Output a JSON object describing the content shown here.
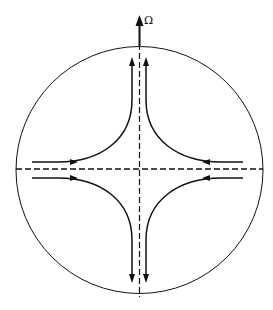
{
  "diagram": {
    "rotation_axis_label": "Ω",
    "colors": {
      "background": "#ffffff",
      "stroke": "#111111"
    },
    "circle": {
      "cx": 139.5,
      "cy": 170,
      "r": 123.5
    },
    "axes": [
      {
        "name": "horizontal-axis",
        "style": "dashed"
      },
      {
        "name": "vertical-axis",
        "style": "dashed"
      },
      {
        "name": "rotation-axis",
        "style": "solid-arrow",
        "label": "Ω"
      }
    ],
    "streamlines": [
      {
        "name": "upper-left",
        "from": "left",
        "to": "up"
      },
      {
        "name": "upper-right",
        "from": "right",
        "to": "up"
      },
      {
        "name": "lower-left",
        "from": "left",
        "to": "down"
      },
      {
        "name": "lower-right",
        "from": "right",
        "to": "down"
      }
    ]
  }
}
